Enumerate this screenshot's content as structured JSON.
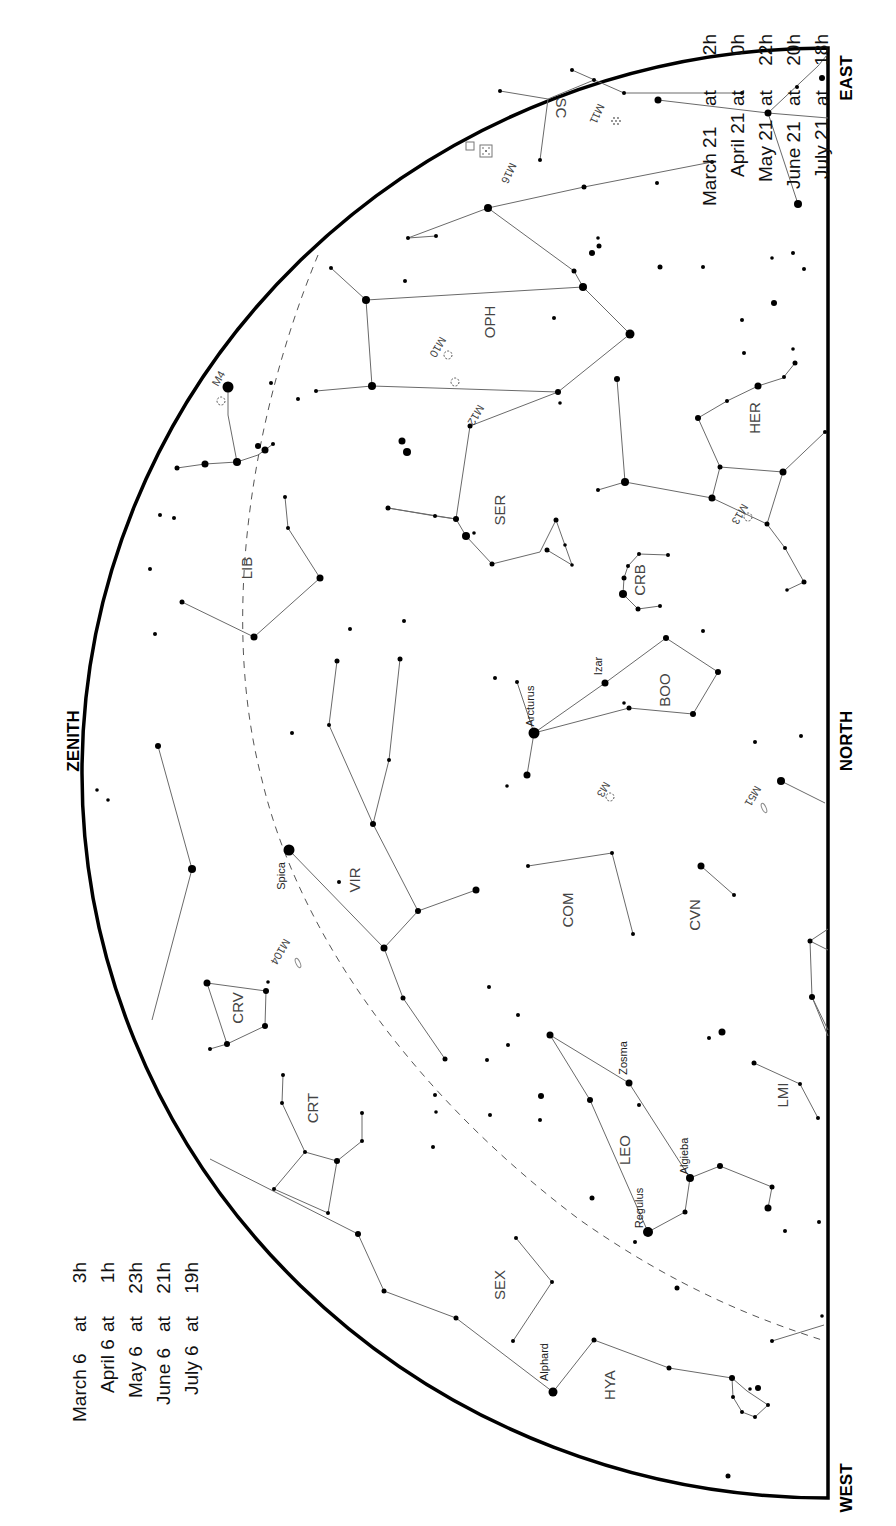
{
  "directions": {
    "zenith": "ZENITH",
    "north": "NORTH",
    "east": "EAST",
    "west": "WEST"
  },
  "time_tables": {
    "left": [
      {
        "date": "March 6",
        "at": "at",
        "time": "3h"
      },
      {
        "date": "April 6",
        "at": "at",
        "time": "1h"
      },
      {
        "date": "May 6",
        "at": "at",
        "time": "23h"
      },
      {
        "date": "June 6",
        "at": "at",
        "time": "21h"
      },
      {
        "date": "July 6",
        "at": "at",
        "time": "19h"
      }
    ],
    "right": [
      {
        "date": "March 21",
        "at": "at",
        "time": "2h"
      },
      {
        "date": "April 21",
        "at": "at",
        "time": "0h"
      },
      {
        "date": "May 21",
        "at": "at",
        "time": "22h"
      },
      {
        "date": "June 21",
        "at": "at",
        "time": "20h"
      },
      {
        "date": "July 21",
        "at": "at",
        "time": "18h"
      }
    ]
  },
  "constellations": [
    {
      "abbr": "SCO",
      "label": "SC",
      "x": 548,
      "y": 108
    },
    {
      "abbr": "OPH",
      "label": "OPH",
      "x": 500,
      "y": 322
    },
    {
      "abbr": "HER",
      "label": "HER",
      "x": 755,
      "y": 418
    },
    {
      "abbr": "SER",
      "label": "SER",
      "x": 500,
      "y": 510
    },
    {
      "abbr": "LIB",
      "label": "LIB",
      "x": 247,
      "y": 568
    },
    {
      "abbr": "CRB",
      "label": "CRB",
      "x": 640,
      "y": 580
    },
    {
      "abbr": "BOO",
      "label": "BOO",
      "x": 665,
      "y": 690
    },
    {
      "abbr": "VIR",
      "label": "VIR",
      "x": 355,
      "y": 880
    },
    {
      "abbr": "COM",
      "label": "COM",
      "x": 568,
      "y": 910
    },
    {
      "abbr": "CVN",
      "label": "CVN",
      "x": 695,
      "y": 915
    },
    {
      "abbr": "CRV",
      "label": "CRV",
      "x": 238,
      "y": 1008
    },
    {
      "abbr": "CRT",
      "label": "CRT",
      "x": 313,
      "y": 1108
    },
    {
      "abbr": "LMI",
      "label": "LMI",
      "x": 783,
      "y": 1095
    },
    {
      "abbr": "LEO",
      "label": "LEO",
      "x": 625,
      "y": 1150
    },
    {
      "abbr": "SEX",
      "label": "SEX",
      "x": 500,
      "y": 1285
    },
    {
      "abbr": "HYA",
      "label": "HYA",
      "x": 610,
      "y": 1385
    }
  ],
  "named_stars": [
    {
      "name": "Arcturus",
      "x": 534,
      "y": 733,
      "lx": 530,
      "ly": 706
    },
    {
      "name": "Izar",
      "x": 605,
      "y": 683,
      "lx": 600,
      "ly": 668
    },
    {
      "name": "Spica",
      "x": 289,
      "y": 850,
      "lx": 284,
      "ly": 878
    },
    {
      "name": "Zosma",
      "x": 629,
      "y": 1083,
      "lx": 625,
      "ly": 1060
    },
    {
      "name": "Algieba",
      "x": 690,
      "y": 1178,
      "lx": 684,
      "ly": 1158
    },
    {
      "name": "Regulus",
      "x": 648,
      "y": 1232,
      "lx": 640,
      "ly": 1212
    },
    {
      "name": "Alphard",
      "x": 553,
      "y": 1392,
      "lx": 546,
      "ly": 1365
    }
  ],
  "deep_sky_objects": [
    {
      "id": "M11",
      "type": "open",
      "x": 616,
      "y": 120,
      "lx": 598,
      "ly": 105
    },
    {
      "id": "M16",
      "type": "open",
      "x": 486,
      "y": 152,
      "lx": 505,
      "ly": 162
    },
    {
      "id": "M17",
      "type": "open",
      "x": 470,
      "y": 147,
      "lx": 0,
      "ly": 0
    },
    {
      "id": "M10",
      "type": "globular",
      "x": 448,
      "y": 355,
      "lx": 436,
      "ly": 338
    },
    {
      "id": "M12",
      "type": "globular",
      "x": 455,
      "y": 382,
      "lx": 470,
      "ly": 400
    },
    {
      "id": "M4",
      "type": "globular",
      "x": 221,
      "y": 401,
      "lx": 214,
      "ly": 390
    },
    {
      "id": "M13",
      "type": "globular",
      "x": 748,
      "y": 517,
      "lx": 740,
      "ly": 505
    },
    {
      "id": "M3",
      "type": "globular",
      "x": 610,
      "y": 797,
      "lx": 598,
      "ly": 785
    },
    {
      "id": "M51",
      "type": "galaxy",
      "x": 764,
      "y": 808,
      "lx": 750,
      "ly": 790
    },
    {
      "id": "M104",
      "type": "galaxy",
      "x": 298,
      "y": 963,
      "lx": 290,
      "ly": 943
    }
  ],
  "colors": {
    "background": "#ffffff",
    "boundary": "#000000",
    "lines": "#6a6a6a",
    "text": "#444444"
  }
}
